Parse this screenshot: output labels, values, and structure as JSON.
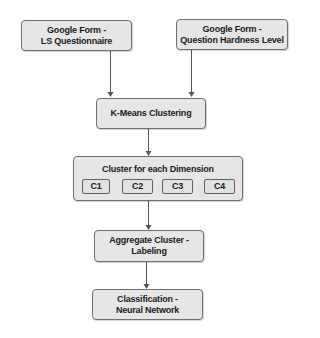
{
  "diagram": {
    "nodes": {
      "form_ls": {
        "label": "Google Form -\nLS Questionnaire"
      },
      "form_hardness": {
        "label": "Google Form -\nQuestion Hardness Level"
      },
      "kmeans": {
        "label": "K-Means Clustering"
      },
      "cluster": {
        "label": "Cluster for each Dimension",
        "children": [
          {
            "label": "C1"
          },
          {
            "label": "C2"
          },
          {
            "label": "C3"
          },
          {
            "label": "C4"
          }
        ]
      },
      "aggregate": {
        "label": "Aggregate Cluster -\nLabeling"
      },
      "classification": {
        "label": "Classification -\nNeural Network"
      }
    },
    "edges": [
      {
        "from": "form_ls",
        "to": "kmeans"
      },
      {
        "from": "form_hardness",
        "to": "kmeans"
      },
      {
        "from": "kmeans",
        "to": "cluster"
      },
      {
        "from": "cluster",
        "to": "aggregate"
      },
      {
        "from": "aggregate",
        "to": "classification"
      }
    ],
    "colors": {
      "node_fill": "#e6e6e6",
      "node_border": "#707070",
      "edge": "#555555"
    }
  }
}
